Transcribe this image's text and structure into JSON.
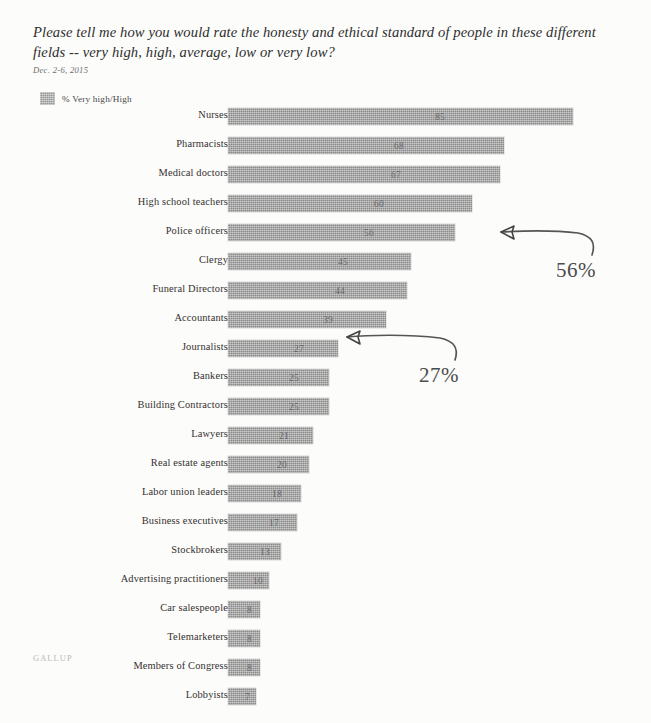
{
  "header": {
    "question": "Please tell me how you would rate the honesty and ethical standard of people in these different fields -- very high, high, average, low or very low?",
    "date": "Dec. 2-6, 2015"
  },
  "legend": {
    "label": "% Very high/High",
    "swatch_color": "#8b8b8b",
    "swatch_icon": "legend-square-icon"
  },
  "footer": {
    "logo_text": "GALLUP"
  },
  "annotations": [
    {
      "id": "annot-56",
      "text": "56%",
      "points_at": "Police officers"
    },
    {
      "id": "annot-27",
      "text": "27%",
      "points_at": "Journalists"
    }
  ],
  "chart_data": {
    "type": "bar",
    "orientation": "horizontal",
    "title": "Please tell me how you would rate the honesty and ethical standard of people in these different fields -- very high, high, average, low or very low?",
    "subtitle": "Dec. 2-6, 2015",
    "xlabel": "",
    "ylabel": "",
    "xlim": [
      0,
      85
    ],
    "grid": false,
    "legend_position": "top-left",
    "series": [
      {
        "name": "% Very high/High",
        "color": "#8b8b8b",
        "values": [
          85,
          68,
          67,
          60,
          56,
          45,
          44,
          39,
          27,
          25,
          25,
          21,
          20,
          18,
          17,
          13,
          10,
          8,
          8,
          8,
          7
        ]
      }
    ],
    "categories": [
      "Nurses",
      "Pharmacists",
      "Medical doctors",
      "High school teachers",
      "Police officers",
      "Clergy",
      "Funeral Directors",
      "Accountants",
      "Journalists",
      "Bankers",
      "Building Contractors",
      "Lawyers",
      "Real estate agents",
      "Labor union leaders",
      "Business executives",
      "Stockbrokers",
      "Advertising practitioners",
      "Car salespeople",
      "Telemarketers",
      "Members of Congress",
      "Lobbyists"
    ],
    "annotations": [
      {
        "text": "56%",
        "category": "Police officers",
        "value": 56
      },
      {
        "text": "27%",
        "category": "Journalists",
        "value": 27
      }
    ]
  }
}
